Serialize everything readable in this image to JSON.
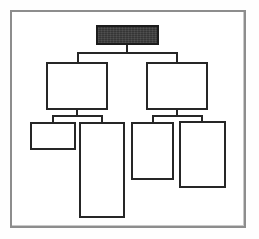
{
  "document": {
    "title": "Hierarchy Diagram",
    "background_color": "#fefefe",
    "frame_border_color": "#8d8d8d",
    "node_border_color": "#262626",
    "root_fill_color": "#3d3d3d"
  },
  "diagram": {
    "type": "tree",
    "levels": 3,
    "nodes": [
      {
        "id": "n0",
        "label": "",
        "level": 0,
        "fill": "filled-dark",
        "x": 96,
        "y": 25,
        "w": 63,
        "h": 20
      },
      {
        "id": "n1",
        "label": "",
        "level": 1,
        "fill": "empty",
        "x": 46,
        "y": 62,
        "w": 62,
        "h": 48
      },
      {
        "id": "n2",
        "label": "",
        "level": 1,
        "fill": "empty",
        "x": 146,
        "y": 62,
        "w": 62,
        "h": 48
      },
      {
        "id": "n3",
        "label": "",
        "level": 2,
        "fill": "empty",
        "x": 30,
        "y": 122,
        "w": 46,
        "h": 28
      },
      {
        "id": "n4",
        "label": "",
        "level": 2,
        "fill": "empty",
        "x": 79,
        "y": 122,
        "w": 46,
        "h": 96
      },
      {
        "id": "n5",
        "label": "",
        "level": 2,
        "fill": "empty",
        "x": 131,
        "y": 122,
        "w": 43,
        "h": 58
      },
      {
        "id": "n6",
        "label": "",
        "level": 2,
        "fill": "empty",
        "x": 179,
        "y": 121,
        "w": 47,
        "h": 67
      }
    ],
    "edges": [
      {
        "from": "n0",
        "to": "n1"
      },
      {
        "from": "n0",
        "to": "n2"
      },
      {
        "from": "n1",
        "to": "n3"
      },
      {
        "from": "n1",
        "to": "n4"
      },
      {
        "from": "n2",
        "to": "n5"
      },
      {
        "from": "n2",
        "to": "n6"
      }
    ]
  }
}
